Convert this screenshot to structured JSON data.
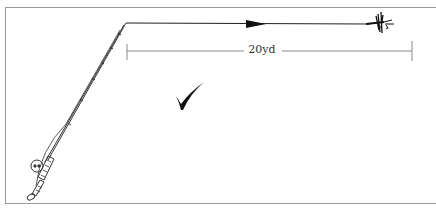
{
  "diagram": {
    "distance_label": "20yd",
    "elements": [
      {
        "name": "fly-rod",
        "description": "fly rod with reel, angled from lower-left to top"
      },
      {
        "name": "fly-line",
        "description": "line from rod tip extending right with direction arrow"
      },
      {
        "name": "fly",
        "description": "dry fly at end of line"
      },
      {
        "name": "distance-dimension",
        "description": "dimension line spanning line length"
      },
      {
        "name": "check-mark",
        "description": "correct-technique tick mark"
      }
    ],
    "colors": {
      "ink": "#1a1a1a",
      "frame": "#9a9a9a",
      "dimension": "#8a8a8a"
    }
  }
}
